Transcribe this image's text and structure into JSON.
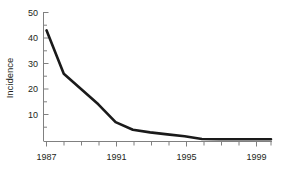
{
  "chart_data": {
    "type": "line",
    "title": "",
    "xlabel": "",
    "ylabel": "Incidence",
    "xlim": [
      1987,
      2000
    ],
    "ylim": [
      0,
      50
    ],
    "grid": false,
    "legend": null,
    "x_major_ticks": [
      1987,
      1991,
      1995,
      1999
    ],
    "x_major_tick_labels": [
      "1987",
      "1991",
      "1995",
      "1999"
    ],
    "x_minor_ticks": [
      1988,
      1989,
      1990,
      1992,
      1993,
      1994,
      1996,
      1997,
      1998,
      2000
    ],
    "y_major_ticks": [
      10,
      20,
      30,
      40,
      50
    ],
    "y_major_tick_labels": [
      "10",
      "20",
      "30",
      "40",
      "50"
    ],
    "y_minor_ticks": [
      5,
      15,
      25,
      35,
      45
    ],
    "x": [
      1987,
      1988,
      1989,
      1990,
      1991,
      1992,
      1993,
      1994,
      1995,
      1996,
      1997,
      1998,
      1999,
      2000
    ],
    "values": [
      43,
      26,
      20,
      14,
      7,
      4,
      3,
      2.2,
      1.5,
      0.4,
      0.3,
      0.3,
      0.3,
      0.3
    ],
    "series": [
      {
        "name": "Incidence",
        "color": "#1a1a1a",
        "line_width": 2.6,
        "values": [
          43,
          26,
          20,
          14,
          7,
          4,
          3,
          2.2,
          1.5,
          0.4,
          0.3,
          0.3,
          0.3,
          0.3
        ]
      }
    ],
    "axis_color": "#808080",
    "text_color": "#231f20"
  },
  "labels": {
    "y_axis_title": "Incidence",
    "y_50": "50",
    "y_40": "40",
    "y_30": "30",
    "y_20": "20",
    "y_10": "10",
    "x_1987": "1987",
    "x_1991": "1991",
    "x_1995": "1995",
    "x_1999": "1999"
  }
}
